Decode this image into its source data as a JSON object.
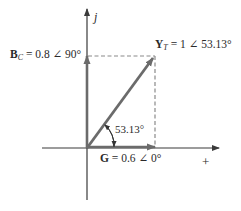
{
  "diagram": {
    "type": "phasor-diagram",
    "axes": {
      "imag_label": "j",
      "real_label": "+"
    },
    "phasors": [
      {
        "id": "G",
        "symbol": "G",
        "subscript": "",
        "text": "= 0.6 ∠ 0°",
        "magnitude": 0.6,
        "angle_deg": 0
      },
      {
        "id": "BC",
        "symbol": "B",
        "subscript": "C",
        "text": "= 0.8 ∠ 90°",
        "magnitude": 0.8,
        "angle_deg": 90
      },
      {
        "id": "YT",
        "symbol": "Y",
        "subscript": "T",
        "text": "= 1 ∠ 53.13°",
        "magnitude": 1,
        "angle_deg": 53.13
      }
    ],
    "angle_annotation": "53.13°",
    "colors": {
      "phasor": "#6b6b6b",
      "axis": "#3a3a3a",
      "dashed": "#8a8a8a"
    }
  }
}
